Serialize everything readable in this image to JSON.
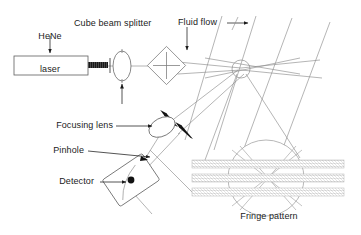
{
  "figure": {
    "background_color": "#ffffff",
    "line_color": "#8c8c8c",
    "solid_color": "#1b1b1b",
    "fringe_color": "#9a9a9a"
  },
  "labels": {
    "hene_line1": "HeNe",
    "hene_line2": "laser",
    "cube_beam_splitter": "Cube beam splitter",
    "fluid_flow": "Fluid flow",
    "focusing_lens": "Focusing lens",
    "pinhole": "Pinhole",
    "detector": "Detector",
    "fringe_pattern": "Fringe pattern"
  },
  "components": [
    {
      "id": "hene-laser",
      "label": "HeNe laser",
      "shape": "rectangle"
    },
    {
      "id": "laser-beam",
      "label": "laser beam",
      "shape": "hatched-bar"
    },
    {
      "id": "collimating-lens",
      "label": "collimating lens",
      "shape": "lens"
    },
    {
      "id": "cube-beam-splitter",
      "label": "Cube beam splitter",
      "shape": "diamond"
    },
    {
      "id": "measurement-volume",
      "label": "measurement volume",
      "shape": "circle"
    },
    {
      "id": "focusing-lens",
      "label": "Focusing lens",
      "shape": "lens"
    },
    {
      "id": "detector",
      "label": "Detector",
      "shape": "rotated-rectangle"
    },
    {
      "id": "pinhole",
      "label": "Pinhole",
      "shape": "dot"
    },
    {
      "id": "fringe-pattern",
      "label": "Fringe pattern",
      "shape": "circle-with-bands"
    }
  ],
  "fringe_detail": {
    "band_count": 3,
    "band_label": "Fringe pattern"
  }
}
